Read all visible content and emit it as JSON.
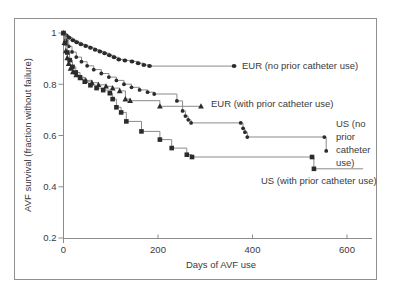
{
  "figure": {
    "background": "#ffffff",
    "border_color": "#909090"
  },
  "chart_data": {
    "type": "line",
    "subtype": "kaplan-meier-step-survival",
    "title": "",
    "xlabel": "Days of AVF use",
    "ylabel": "AVF survival (fraction without failure)",
    "x_ticks": [
      0,
      200,
      400,
      600
    ],
    "y_ticks": [
      1,
      0.8,
      0.6,
      0.4,
      0.2
    ],
    "x_range": [
      0,
      660
    ],
    "y_range": [
      0.2,
      1.0
    ],
    "grid": false,
    "legend_position": "inline-annotations",
    "axis_color": "#8c8c8c",
    "line_color": "#8a8a8a",
    "marker_color": "#2b2b2b",
    "series": [
      {
        "name": "EUR (no prior catheter use)",
        "marker": "circle",
        "label": {
          "text": "EUR (no prior catheter use)"
        },
        "points": [
          [
            0,
            1.0
          ],
          [
            6,
            0.99
          ],
          [
            12,
            0.981
          ],
          [
            20,
            0.972
          ],
          [
            28,
            0.964
          ],
          [
            37,
            0.956
          ],
          [
            47,
            0.949
          ],
          [
            57,
            0.942
          ],
          [
            67,
            0.935
          ],
          [
            77,
            0.928
          ],
          [
            87,
            0.921
          ],
          [
            97,
            0.913
          ],
          [
            107,
            0.905
          ],
          [
            117,
            0.897
          ],
          [
            130,
            0.893
          ],
          [
            145,
            0.889
          ],
          [
            158,
            0.882
          ],
          [
            170,
            0.875
          ],
          [
            182,
            0.871
          ],
          [
            361,
            0.871
          ]
        ]
      },
      {
        "name": "EUR (with prior catheter use)",
        "marker": "triangle",
        "label": {
          "text": "EUR (with prior catheter use)"
        },
        "points": [
          [
            0,
            1.0
          ],
          [
            2,
            0.962
          ],
          [
            5,
            0.93
          ],
          [
            8,
            0.903
          ],
          [
            11,
            0.88
          ],
          [
            15,
            0.862
          ],
          [
            20,
            0.848
          ],
          [
            27,
            0.836
          ],
          [
            36,
            0.825
          ],
          [
            47,
            0.815
          ],
          [
            60,
            0.806
          ],
          [
            74,
            0.798
          ],
          [
            90,
            0.792
          ],
          [
            104,
            0.785
          ],
          [
            119,
            0.774
          ],
          [
            131,
            0.742
          ],
          [
            141,
            0.736
          ],
          [
            204,
            0.714
          ],
          [
            291,
            0.714
          ]
        ]
      },
      {
        "name": "US (no prior catheter use)",
        "marker": "dot",
        "label": {
          "text": "US (no prior catheter use)"
        },
        "points": [
          [
            0,
            1.0
          ],
          [
            5,
            0.972
          ],
          [
            11,
            0.948
          ],
          [
            18,
            0.926
          ],
          [
            27,
            0.906
          ],
          [
            38,
            0.888
          ],
          [
            50,
            0.872
          ],
          [
            64,
            0.857
          ],
          [
            80,
            0.842
          ],
          [
            96,
            0.828
          ],
          [
            112,
            0.815
          ],
          [
            128,
            0.8
          ],
          [
            144,
            0.788
          ],
          [
            161,
            0.778
          ],
          [
            178,
            0.769
          ],
          [
            192,
            0.762
          ],
          [
            240,
            0.735
          ],
          [
            252,
            0.696
          ],
          [
            258,
            0.676
          ],
          [
            264,
            0.661
          ],
          [
            270,
            0.649
          ],
          [
            375,
            0.649
          ],
          [
            380,
            0.628
          ],
          [
            384,
            0.613
          ],
          [
            389,
            0.594
          ],
          [
            552,
            0.594
          ],
          [
            556,
            0.54
          ]
        ]
      },
      {
        "name": "US (with prior catheter use)",
        "marker": "square",
        "label": {
          "text": "US (with prior catheter use)"
        },
        "points": [
          [
            0,
            1.0
          ],
          [
            4,
            0.96
          ],
          [
            8,
            0.924
          ],
          [
            13,
            0.894
          ],
          [
            19,
            0.868
          ],
          [
            26,
            0.846
          ],
          [
            35,
            0.827
          ],
          [
            45,
            0.81
          ],
          [
            57,
            0.796
          ],
          [
            70,
            0.785
          ],
          [
            84,
            0.777
          ],
          [
            98,
            0.765
          ],
          [
            104,
            0.742
          ],
          [
            112,
            0.71
          ],
          [
            122,
            0.69
          ],
          [
            133,
            0.655
          ],
          [
            165,
            0.616
          ],
          [
            204,
            0.584
          ],
          [
            229,
            0.551
          ],
          [
            261,
            0.525
          ],
          [
            272,
            0.516
          ],
          [
            526,
            0.516
          ],
          [
            530,
            0.47
          ],
          [
            634,
            0.47,
            0
          ]
        ]
      }
    ]
  }
}
